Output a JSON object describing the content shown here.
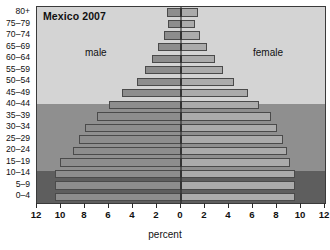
{
  "chart_data": {
    "type": "bar",
    "subtype": "population-pyramid",
    "title": "Mexico 2007",
    "xlabel": "percent",
    "ylabel": "",
    "xlim": [
      -12,
      12
    ],
    "xticks": [
      12,
      10,
      8,
      6,
      4,
      2,
      0,
      2,
      4,
      6,
      8,
      10,
      12
    ],
    "grid": false,
    "legend_position": "inside-plot",
    "categories": [
      "80+",
      "75-79",
      "70-74",
      "65-69",
      "60-64",
      "55-59",
      "50-54",
      "45-49",
      "40-44",
      "35-39",
      "30-34",
      "25-29",
      "20-24",
      "15-19",
      "10-14",
      "5-9",
      "0-4"
    ],
    "series": [
      {
        "name": "male",
        "color": "#8d8d8d",
        "values": [
          1.2,
          1.1,
          1.4,
          1.9,
          2.4,
          3.0,
          3.7,
          4.9,
          6.0,
          7.0,
          8.0,
          8.5,
          9.0,
          10.1,
          10.5,
          10.5,
          10.5
        ]
      },
      {
        "name": "female",
        "color": "#ababab",
        "values": [
          1.4,
          1.2,
          1.6,
          2.2,
          2.8,
          3.5,
          4.4,
          5.6,
          6.5,
          7.5,
          8.0,
          8.5,
          8.8,
          9.1,
          9.5,
          9.5,
          9.5
        ]
      }
    ],
    "annotations": [
      {
        "text": "male",
        "position": "left-upper"
      },
      {
        "text": "female",
        "position": "right-upper"
      }
    ],
    "background_bands": [
      {
        "name": "older-band",
        "from_category": "80+",
        "to_category": "45-49",
        "color": "#d4d4d4"
      },
      {
        "name": "middle-band",
        "from_category": "40-44",
        "to_category": "15-19",
        "color": "#8f8f8f"
      },
      {
        "name": "younger-band",
        "from_category": "10-14",
        "to_category": "0-4",
        "color": "#5e5e5e"
      }
    ]
  },
  "colors": {
    "male_bar": "#8d8d8d",
    "female_bar": "#ababab",
    "bar_border": "#4a4a4a",
    "axis_line": "#1c1c1c",
    "frame": "#3a3a3a",
    "text": "#111111"
  }
}
